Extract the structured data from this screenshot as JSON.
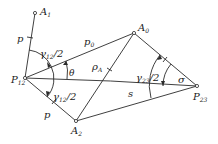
{
  "diagram": {
    "points": {
      "A1": {
        "label": "A",
        "sub": "1"
      },
      "A0": {
        "label": "A",
        "sub": "0"
      },
      "A2": {
        "label": "A",
        "sub": "2"
      },
      "P12": {
        "label": "P",
        "sub": "12"
      },
      "P23": {
        "label": "P",
        "sub": "23"
      }
    },
    "labels": {
      "p_upper": "p",
      "p_lower": "p",
      "p0": "p",
      "p0_sub": "0",
      "rhoA": "ρ",
      "rhoA_sub": "A",
      "theta": "θ",
      "s": "s",
      "sigma": "σ",
      "gamma12_upper": "γ",
      "gamma12_upper_sub": "12",
      "gamma12_upper_tail": "/2",
      "gamma12_lower": "γ",
      "gamma12_lower_sub": "12",
      "gamma12_lower_tail": "/2",
      "gamma23": "γ",
      "gamma23_sub": "23",
      "gamma23_tail": "/2"
    },
    "colors": {
      "line": "#2a2a2a",
      "background": "#ffffff"
    }
  }
}
